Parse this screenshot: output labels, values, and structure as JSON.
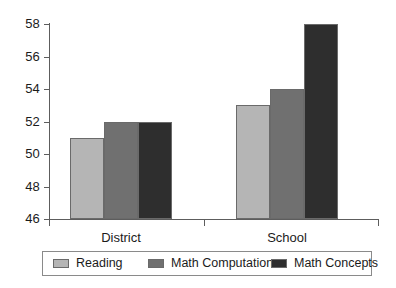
{
  "chart_data": {
    "type": "bar",
    "title": "",
    "subtitle": "",
    "xlabel": "",
    "ylabel": "",
    "categories": [
      "District",
      "School"
    ],
    "series": [
      {
        "name": "Reading",
        "values": [
          51,
          53
        ],
        "color": "#b5b5b5"
      },
      {
        "name": "Math Computation",
        "values": [
          52,
          54
        ],
        "color": "#707070"
      },
      {
        "name": "Math Concepts",
        "values": [
          52,
          58
        ],
        "color": "#2e2e2e"
      }
    ],
    "ylim": [
      46,
      58
    ],
    "yticks": [
      46,
      48,
      50,
      52,
      54,
      56,
      58
    ],
    "ytick_labels": [
      "46",
      "48",
      "50",
      "52",
      "54",
      "56",
      "58"
    ],
    "grid": false,
    "legend_position": "bottom",
    "annotations": []
  },
  "colors": {
    "axis": "#5d5d5d",
    "bar_outline": "#6a6a6a",
    "legend_border": "#8a8a8a",
    "text": "#1b1b1b",
    "background": "#ffffff"
  }
}
